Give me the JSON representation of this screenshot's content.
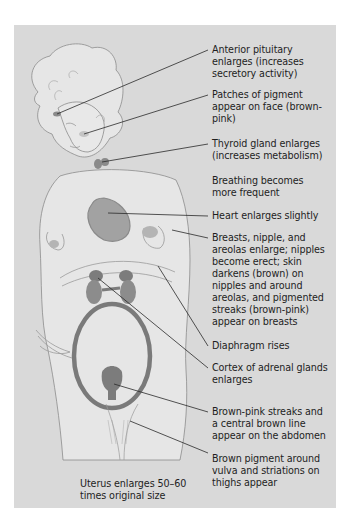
{
  "figure": {
    "colors": {
      "background": "#d9d9d9",
      "skin": "#e6e6e6",
      "outline": "#8c8c8c",
      "organ": "#8f8f8f",
      "organ_dark": "#767676",
      "leader": "#2a2a2a",
      "text": "#1e1e1e"
    },
    "labels": [
      {
        "id": "pituitary",
        "text": "Anterior pituitary\nenlarges (increases\nsecretory activity)"
      },
      {
        "id": "face-pigment",
        "text": "Patches of pigment\nappear on face (brown-\npink)"
      },
      {
        "id": "thyroid",
        "text": "Thyroid gland enlarges\n(increases metabolism)"
      },
      {
        "id": "breathing",
        "text": "Breathing becomes\nmore frequent"
      },
      {
        "id": "heart",
        "text": "Heart enlarges slightly"
      },
      {
        "id": "breasts",
        "text": "Breasts, nipple, and\nareolas enlarge; nipples\nbecome erect; skin\ndarkens (brown) on\nnipples and around\nareolas, and pigmented\nstreaks (brown-pink)\nappear on breasts"
      },
      {
        "id": "diaphragm",
        "text": "Diaphragm rises"
      },
      {
        "id": "adrenal",
        "text": "Cortex of adrenal glands\nenlarges"
      },
      {
        "id": "abdomen",
        "text": "Brown-pink streaks and\na central brown line\nappear on the abdomen"
      },
      {
        "id": "vulva",
        "text": "Brown pigment around\nvulva and striations on\nthighs appear"
      },
      {
        "id": "uterus",
        "text": "Uterus enlarges 50–60\ntimes original size"
      }
    ]
  }
}
